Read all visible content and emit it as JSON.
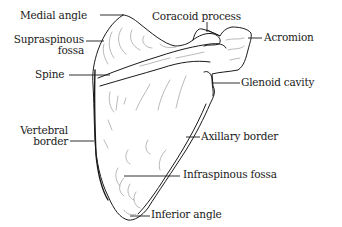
{
  "figure": {
    "labels": {
      "medial_angle": "Medial angle",
      "coracoid_process": "Coracoid process",
      "supraspinous_fossa_line1": "Supraspinous",
      "supraspinous_fossa_line2": "fossa",
      "acromion": "Acromion",
      "spine": "Spine",
      "glenoid_cavity": "Glenoid cavity",
      "vertebral_border_line1": "Vertebral",
      "vertebral_border_line2": "border",
      "axillary_border": "Axillary border",
      "infraspinous_fossa": "Infraspinous fossa",
      "inferior_angle": "Inferior angle"
    },
    "colors": {
      "ink": "#1a1a1a",
      "shading": "#8a8a8a",
      "background": "#ffffff"
    }
  }
}
